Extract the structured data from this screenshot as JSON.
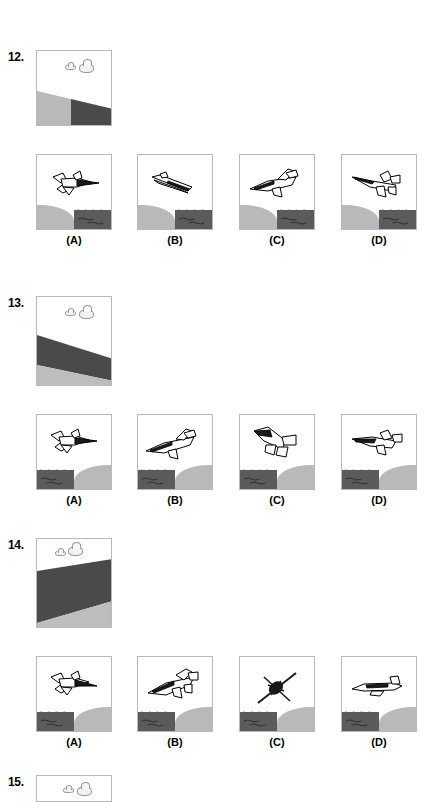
{
  "page": {
    "background": "#ffffff",
    "ink": "#000000",
    "land_color": "#b9b9b9",
    "water_color": "#5b5b5b",
    "panel_border": "#b9b9b9",
    "cloud_color": "#f2f2f2"
  },
  "questions": [
    {
      "number": "12.",
      "stimulus": {
        "description": "horizon-tilted-left-land-light-left-dark-right",
        "clouds": 2,
        "terrain": "diagonal-split"
      },
      "options": [
        {
          "label": "(A)",
          "plane": "banked-left-top-view",
          "terrain": "land-left-water-right"
        },
        {
          "label": "(B)",
          "plane": "edge-on-diving",
          "terrain": "land-left-water-right"
        },
        {
          "label": "(C)",
          "plane": "nose-left-level",
          "terrain": "land-left-water-right"
        },
        {
          "label": "(D)",
          "plane": "nose-left-climbing",
          "terrain": "land-left-water-right"
        }
      ]
    },
    {
      "number": "13.",
      "stimulus": {
        "description": "dark-band-diagonal-over-light-ground",
        "clouds": 2,
        "terrain": "diagonal-band"
      },
      "options": [
        {
          "label": "(A)",
          "plane": "banked-left-top-view",
          "terrain": "water-left-land-right"
        },
        {
          "label": "(B)",
          "plane": "nose-left-level",
          "terrain": "water-left-land-right"
        },
        {
          "label": "(C)",
          "plane": "nose-left-climbing",
          "terrain": "water-left-land-right"
        },
        {
          "label": "(D)",
          "plane": "banked-left-shallow",
          "terrain": "water-left-land-right"
        }
      ]
    },
    {
      "number": "14.",
      "stimulus": {
        "description": "steep-dark-band-diagonal",
        "clouds": 2,
        "terrain": "diagonal-band-steep"
      },
      "options": [
        {
          "label": "(A)",
          "plane": "banked-left-top-view",
          "terrain": "water-left-land-right"
        },
        {
          "label": "(B)",
          "plane": "nose-left-climbing",
          "terrain": "water-left-land-right"
        },
        {
          "label": "(C)",
          "plane": "head-on-dark",
          "terrain": "water-left-land-right"
        },
        {
          "label": "(D)",
          "plane": "side-view-level",
          "terrain": "water-left-land-right"
        }
      ]
    },
    {
      "number": "15.",
      "stimulus": {
        "description": "cut-off-at-page-bottom",
        "clouds": 2,
        "terrain": "partial"
      },
      "options": []
    }
  ]
}
